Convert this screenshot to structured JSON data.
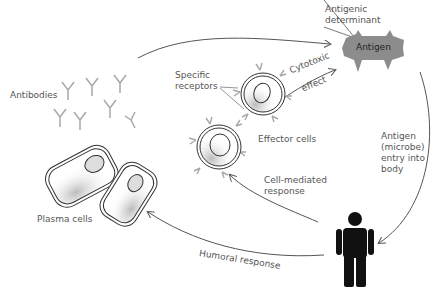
{
  "diagram": {
    "nodes": {
      "antigen": "Antigen",
      "antigenic_determinant": "Antigenic determinant",
      "specific_receptors": "Specific receptors",
      "cytotoxic_effect": "Cytotoxic effect",
      "effector_cells": "Effector cells",
      "antibodies": "Antibodies",
      "plasma_cells": "Plasma cells",
      "person": "Body (human figure)"
    },
    "labels": {
      "antigenic_l1": "Antigenic",
      "antigenic_l2": "determinant",
      "antigen": "Antigen",
      "specific_l1": "Specific",
      "specific_l2": "receptors",
      "cytotoxic": "Cytotoxic",
      "effect": "effect",
      "effector_cells": "Effector cells",
      "antibodies": "Antibodies",
      "plasma_cells": "Plasma cells",
      "cell_mediated_l1": "Cell-mediated",
      "cell_mediated_l2": "response",
      "entry_l1": "Antigen",
      "entry_l2": "(microbe)",
      "entry_l3": "entry into",
      "entry_l4": "body",
      "humoral": "Humoral response"
    },
    "edges": [
      {
        "from": "plasma_cells/antibodies",
        "to": "antigen",
        "label": ""
      },
      {
        "from": "effector_cells",
        "to": "antigen",
        "label": "Cytotoxic effect"
      },
      {
        "from": "antigen",
        "to": "person",
        "label": "Antigen (microbe) entry into body"
      },
      {
        "from": "person",
        "to": "effector_cells",
        "label": "Cell-mediated response"
      },
      {
        "from": "person",
        "to": "plasma_cells",
        "label": "Humoral response"
      }
    ],
    "colors": {
      "antigen_fill": "#8c8c8c",
      "line": "#555555",
      "antibody": "#a8a8a8",
      "person": "#111111"
    }
  }
}
